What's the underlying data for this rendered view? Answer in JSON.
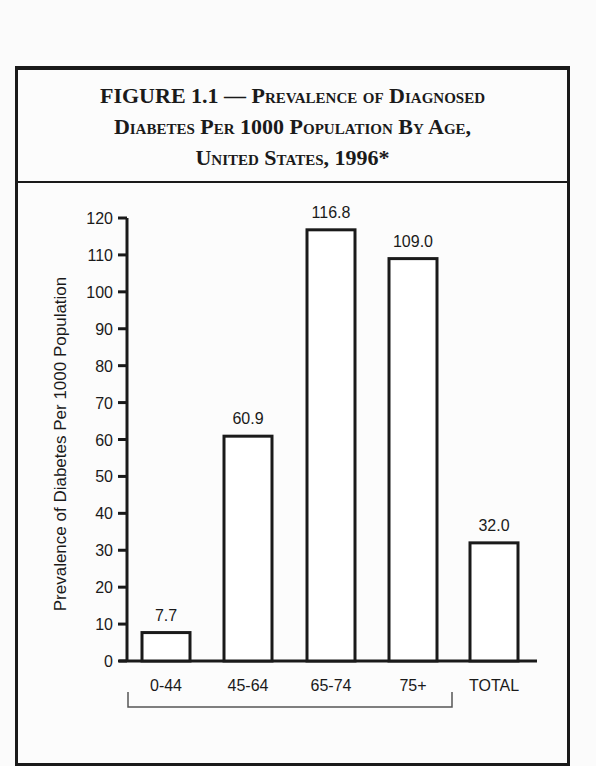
{
  "figure": {
    "title_line1_prefix": "FIGURE 1.1 — ",
    "title_line1_rest": "Prevalence of Diagnosed",
    "title_line2": "Diabetes Per 1000 Population By Age,",
    "title_line3": "United States, 1996*"
  },
  "chart_data": {
    "type": "bar",
    "title": "FIGURE 1.1 — Prevalence of Diagnosed Diabetes Per 1000 Population By Age, United States, 1996*",
    "categories": [
      "0-44",
      "45-64",
      "65-74",
      "75+",
      "TOTAL"
    ],
    "values": [
      7.7,
      60.9,
      116.8,
      109.0,
      32.0
    ],
    "value_labels": [
      "7.7",
      "60.9",
      "116.8",
      "109.0",
      "32.0"
    ],
    "xlabel": "",
    "ylabel": "Prevalence of Diabetes Per 1000 Population",
    "ylim": [
      0,
      120
    ],
    "yticks": [
      0,
      10,
      20,
      30,
      40,
      50,
      60,
      70,
      80,
      90,
      100,
      110,
      120
    ],
    "grid": false,
    "legend": null,
    "annotations": [
      "Bracket beneath age-group categories 0-44 through 75+"
    ]
  }
}
